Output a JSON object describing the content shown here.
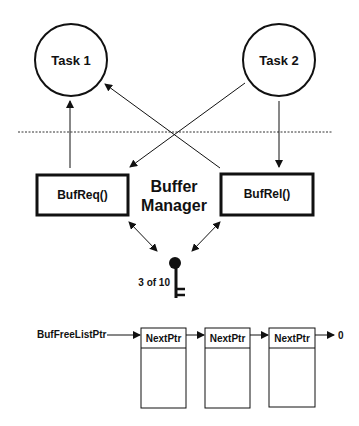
{
  "diagram": {
    "tasks": [
      {
        "label": "Task 1"
      },
      {
        "label": "Task 2"
      }
    ],
    "functions": {
      "request": "BufReq()",
      "release": "BufRel()"
    },
    "manager": {
      "line1": "Buffer",
      "line2": "Manager"
    },
    "semaphore": {
      "icon": "key-icon",
      "count_label": "3 of 10"
    },
    "free_list": {
      "head_label": "BufFreeListPtr",
      "nodes": [
        {
          "field": "NextPtr"
        },
        {
          "field": "NextPtr"
        },
        {
          "field": "NextPtr"
        }
      ],
      "terminator": "0"
    },
    "colors": {
      "ink": "#111111",
      "background": "#ffffff"
    }
  }
}
